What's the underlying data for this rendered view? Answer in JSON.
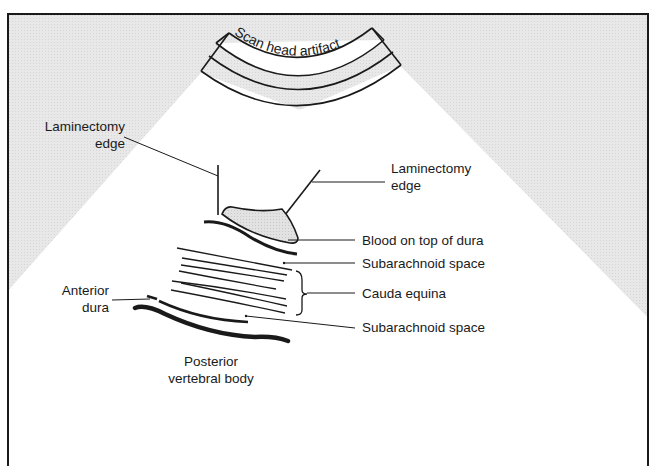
{
  "diagram": {
    "type": "ultrasound schematic",
    "colors": {
      "background_outside_fan": "#e6e6e6",
      "fan": "#ffffff",
      "line": "#1a1a1a",
      "blood_fill": "#dcdcdc"
    },
    "scan_head_label": "Scan head artifact",
    "labels": {
      "laminectomy_edge_left": {
        "line1": "Laminectomy",
        "line2": "edge"
      },
      "laminectomy_edge_right": {
        "line1": "Laminectomy",
        "line2": "edge"
      },
      "blood_on_dura": "Blood on top of dura",
      "subarachnoid_space_upper": "Subarachnoid space",
      "cauda_equina": "Cauda equina",
      "subarachnoid_space_lower": "Subarachnoid space",
      "anterior_dura": {
        "line1": "Anterior",
        "line2": "dura"
      },
      "posterior_vertebral_body": {
        "line1": "Posterior",
        "line2": "vertebral body"
      }
    }
  }
}
